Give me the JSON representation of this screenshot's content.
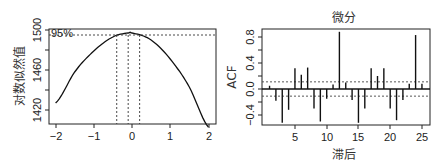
{
  "chart_data": [
    {
      "type": "line",
      "title": "",
      "xlabel": "",
      "ylabel": "对数似然值",
      "xlim": [
        -2,
        2
      ],
      "ylim": [
        1400,
        1502
      ],
      "xticks": [
        -2,
        -1,
        0,
        1,
        2
      ],
      "yticks": [
        1420,
        1460,
        1500
      ],
      "ytick_labels": [
        "1420",
        "1460",
        "1500"
      ],
      "xtick_labels": [
        "-2",
        "−1",
        "0",
        "1",
        "2"
      ],
      "series": [
        {
          "name": "log-likelihood",
          "x": [
            -2.0,
            -1.5,
            -1.0,
            -0.5,
            -0.1,
            0.0,
            0.5,
            1.0,
            1.5,
            2.0
          ],
          "y": [
            1427,
            1458,
            1479,
            1493,
            1497,
            1497,
            1490,
            1471,
            1443,
            1403
          ]
        }
      ],
      "annotations": {
        "ci_label": "95%",
        "ci_level_y": 1495,
        "ci_lower": -0.4,
        "ci_center": -0.1,
        "ci_upper": 0.2
      },
      "grid": false
    },
    {
      "type": "bar",
      "title": "微分",
      "xlabel": "滞后",
      "ylabel": "ACF",
      "xlim": [
        0,
        26
      ],
      "ylim": [
        -0.6,
        0.95
      ],
      "xticks": [
        5,
        10,
        15,
        20,
        25
      ],
      "xtick_labels": [
        "5",
        "10",
        "15",
        "20",
        "25"
      ],
      "yticks": [
        -0.4,
        0.0,
        0.4,
        0.8
      ],
      "ytick_labels": [
        "−0.4",
        "0.0",
        "0.4",
        "0.8"
      ],
      "categories": [
        1,
        2,
        3,
        4,
        5,
        6,
        7,
        8,
        9,
        10,
        11,
        12,
        13,
        14,
        15,
        16,
        17,
        18,
        19,
        20,
        21,
        22,
        23,
        24,
        25
      ],
      "values": [
        0.05,
        -0.18,
        -0.52,
        -0.32,
        0.32,
        0.22,
        0.33,
        -0.3,
        -0.5,
        -0.15,
        0.07,
        0.88,
        0.1,
        -0.17,
        -0.52,
        -0.3,
        0.32,
        0.2,
        0.32,
        -0.3,
        -0.48,
        -0.17,
        0.08,
        0.83,
        0.08
      ],
      "confidence_band": 0.11,
      "grid": false
    }
  ],
  "left": {
    "ylabel": "对数似然值",
    "ci_label": "95%",
    "xtick_labels": [
      "−2",
      "−1",
      "0",
      "1",
      "2"
    ],
    "ytick_labels": [
      "1420",
      "1460",
      "1500"
    ]
  },
  "right": {
    "title": "微分",
    "xlabel": "滞后",
    "ylabel": "ACF",
    "xtick_labels": [
      "5",
      "10",
      "15",
      "20",
      "25"
    ],
    "ytick_labels": [
      "−0.4",
      "0.0",
      "0.4",
      "0.8"
    ]
  }
}
